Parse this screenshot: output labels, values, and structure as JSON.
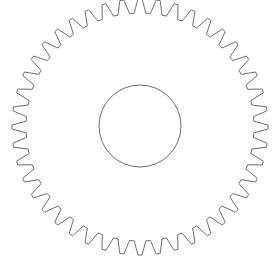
{
  "canvas": {
    "width": 273,
    "height": 262,
    "background": "#ffffff"
  },
  "gear": {
    "center": [
      140,
      127
    ],
    "teeth": 44,
    "tip_radius": 128,
    "root_radius": 114,
    "tip_fraction": 0.22,
    "root_fraction": 0.28,
    "stroke": "#6e6e6e",
    "stroke_width": 1,
    "fill": "none",
    "rotation_deg": 0
  },
  "bore": {
    "center": [
      140,
      126
    ],
    "radius": 41,
    "stroke": "#6e6e6e",
    "stroke_width": 1,
    "fill": "none"
  }
}
